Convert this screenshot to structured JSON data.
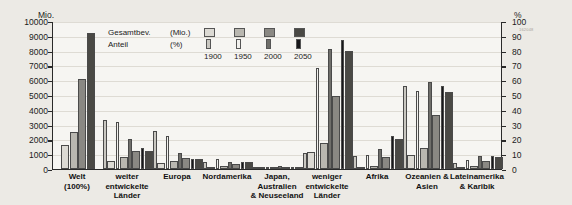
{
  "axes": {
    "left_title": "Mio.",
    "right_title": "%",
    "left_ticks": [
      "10000",
      "9000",
      "8000",
      "7000",
      "6000",
      "5000",
      "4000",
      "3000",
      "2000",
      "1000",
      "0"
    ],
    "right_ticks": [
      "100",
      "90",
      "80",
      "70",
      "60",
      "50",
      "40",
      "30",
      "20",
      "10",
      "0"
    ]
  },
  "legend": {
    "row1_label": "Gesamtbev.",
    "row1_unit": "(Mio.)",
    "row2_label": "Anteil",
    "row2_unit": "(%)",
    "years": [
      "1900",
      "1950",
      "2000",
      "2050"
    ]
  },
  "watermark": "162048",
  "colors": {
    "bg": "#eceae5",
    "plot_bg": "#f6f5f2",
    "year_1900": "#dcdad4",
    "year_1950": "#b9b7b0",
    "year_2000": "#8a8883",
    "year_2050": "#4a4945",
    "anteil_1900": "#c9c7c1",
    "anteil_1950": "#f2f1ee",
    "anteil_2000": "#6f6e6a",
    "anteil_2050": "#17171a"
  },
  "chart_data": {
    "type": "bar",
    "title": "",
    "xlabel": "",
    "ylabel": "Mio.",
    "ylabel_right": "%",
    "ylim": [
      0,
      10000
    ],
    "ylim_right": [
      0,
      100
    ],
    "grid": true,
    "legend_position": "top-left-inside",
    "years": [
      "1900",
      "1950",
      "2000",
      "2050"
    ],
    "categories": [
      "Welt\n(100%)",
      "weiter entwickelte\nLänder",
      "Europa",
      "Nordamerika",
      "Japan, Australien\n& Neuseeland",
      "weniger entwickelte\nLänder",
      "Afrika",
      "Ozeanien &\nAsien",
      "Lateinamerika\n& Karibik"
    ],
    "series": [
      {
        "name": "Gesamtbev. (Mio.)",
        "unit": "Mio.",
        "axis": "left",
        "values_by_category": {
          "Welt (100%)": [
            1650,
            2520,
            6080,
            9200
          ],
          "weiter entwickelte Länder": [
            540,
            830,
            1200,
            1250
          ],
          "Europa": [
            430,
            550,
            730,
            660
          ],
          "Nordamerika": [
            80,
            170,
            320,
            450
          ],
          "Japan, Australien & Neuseeland": [
            50,
            100,
            160,
            140
          ],
          "weniger entwickelte Länder": [
            1120,
            1790,
            4950,
            8000
          ],
          "Afrika": [
            140,
            230,
            820,
            2000
          ],
          "Ozeanien & Asien": [
            950,
            1390,
            3640,
            5200
          ],
          "Lateinamerika & Karibik": [
            70,
            170,
            520,
            780
          ]
        }
      },
      {
        "name": "Anteil (%)",
        "unit": "%",
        "axis": "right",
        "values_by_category": {
          "Welt (100%)": [
            null,
            null,
            null,
            null
          ],
          "weiter entwickelte Länder": [
            33,
            32,
            20,
            14
          ],
          "Europa": [
            26,
            22,
            11,
            7
          ],
          "Nordamerika": [
            5,
            7,
            5,
            5
          ],
          "Japan, Australien & Neuseeland": [
            1,
            1,
            2,
            1
          ],
          "weniger entwickelte Länder": [
            11,
            68,
            81,
            87
          ],
          "Afrika": [
            8.5,
            9.5,
            13.5,
            22
          ],
          "Ozeanien & Asien": [
            56,
            53,
            59,
            56
          ],
          "Lateinamerika & Karibik": [
            4,
            6,
            8.5,
            8.5
          ]
        }
      }
    ]
  }
}
